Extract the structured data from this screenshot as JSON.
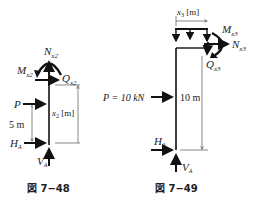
{
  "figure_48": {
    "caption": "図 7−48",
    "labels": {
      "N": "N",
      "N_sub": "x2",
      "M": "M",
      "M_sub": "x2",
      "Q": "Q",
      "Q_sub": "x2",
      "P": "P",
      "dim_5m": "5 m",
      "x": "x",
      "x_sub": "2",
      "x_unit": " [m]",
      "H": "H",
      "H_sub": "A",
      "V": "V",
      "V_sub": "A"
    }
  },
  "figure_49": {
    "caption": "図 7−49",
    "labels": {
      "x": "x",
      "x_sub": "3",
      "x_unit": " [m]",
      "M": "M",
      "M_sub": "x3",
      "N": "N",
      "N_sub": "x3",
      "Q": "Q",
      "Q_sub": "x3",
      "P": "P = 10 kN",
      "dim_10m": "10 m",
      "H": "H",
      "H_sub": "A",
      "V": "V",
      "V_sub": "A"
    }
  },
  "colors": {
    "line": "#111111",
    "dim": "#555555"
  }
}
